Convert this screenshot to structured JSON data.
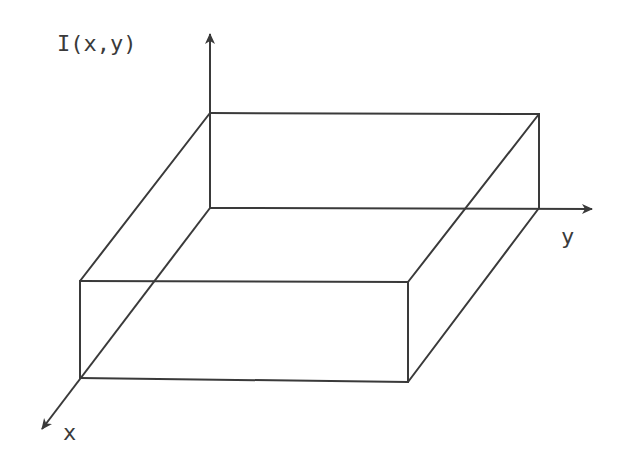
{
  "figure": {
    "type": "3d-box-plot-of-intensity",
    "labels": {
      "z_axis": "I(x,y)",
      "x_axis": "x",
      "y_axis": "y"
    },
    "colors": {
      "line": "#3a3a3a",
      "background": "#ffffff"
    }
  },
  "geometry": {
    "origin": [
      210,
      208
    ],
    "z_axis_tip": [
      210,
      25
    ],
    "y_axis_tip": [
      600,
      209
    ],
    "x_axis_tip": [
      36,
      436
    ],
    "box": {
      "top_back_left": [
        210,
        113
      ],
      "top_back_right": [
        539,
        114
      ],
      "top_front_left": [
        80,
        281
      ],
      "top_front_right": [
        408,
        282
      ],
      "bottom_back_left": [
        210,
        208
      ],
      "bottom_back_right": [
        539,
        208
      ],
      "bottom_front_left": [
        80,
        378
      ],
      "bottom_front_right": [
        408,
        382
      ]
    }
  }
}
